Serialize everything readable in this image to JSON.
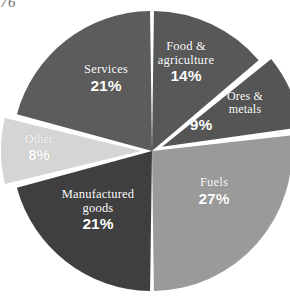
{
  "page_fragment": "76",
  "chart_data": {
    "type": "pie",
    "title": "",
    "subtitle": "",
    "xlabel": "",
    "ylabel": "",
    "legend": "none",
    "grid": false,
    "label_position": "inside-slice",
    "value_suffix": "%",
    "total": 100,
    "start_angle_deg": 0,
    "direction": "clockwise",
    "categories": [
      "Food & agriculture",
      "Ores & metals",
      "Fuels",
      "Manufactured goods",
      "Other",
      "Services"
    ],
    "values": [
      14,
      9,
      27,
      21,
      8,
      21
    ],
    "slices": [
      {
        "label": "Food &\nagriculture",
        "label_line1": "Food &",
        "label_line2": "agriculture",
        "value": 14,
        "value_text": "14%",
        "color": "#585858",
        "exploded": false
      },
      {
        "label": "Ores &\nmetals",
        "label_line1": "Ores &",
        "label_line2": "metals",
        "value": 9,
        "value_text": "9%",
        "color": "#555555",
        "exploded": true
      },
      {
        "label": "Fuels",
        "label_line1": "Fuels",
        "label_line2": "",
        "value": 27,
        "value_text": "27%",
        "color": "#9a9a9a",
        "exploded": false
      },
      {
        "label": "Manufactured\ngoods",
        "label_line1": "Manufactured",
        "label_line2": "goods",
        "value": 21,
        "value_text": "21%",
        "color": "#3f3f3f",
        "exploded": false
      },
      {
        "label": "Other",
        "label_line1": "Other",
        "label_line2": "",
        "value": 8,
        "value_text": "8%",
        "color": "#d5d5d5",
        "exploded": true
      },
      {
        "label": "Services",
        "label_line1": "Services",
        "label_line2": "",
        "value": 21,
        "value_text": "21%",
        "color": "#5c5c5c",
        "exploded": false
      }
    ],
    "background_color": "#ffffff",
    "separator_color": "#ffffff",
    "label_text_color": "#ffffff"
  }
}
